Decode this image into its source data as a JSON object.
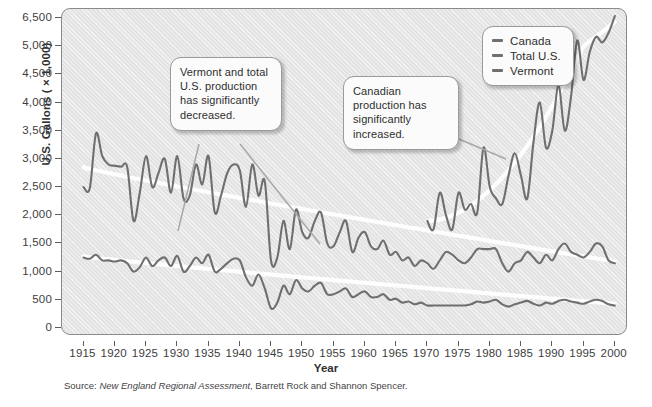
{
  "axis": {
    "ylabel": "U.S. Gallons ( × 1,000)",
    "xlabel": "Year",
    "yticks": [
      "6,500",
      "5,000",
      "4,500",
      "4,000",
      "3,500",
      "3,000",
      "2,500",
      "2,000",
      "1,500",
      "1,000",
      "500",
      "0"
    ],
    "xticks": [
      "1915",
      "1920",
      "1925",
      "1930",
      "1935",
      "1940",
      "1945",
      "1950",
      "1955",
      "1960",
      "1965",
      "1970",
      "1975",
      "1980",
      "1985",
      "1990",
      "1995",
      "2000"
    ]
  },
  "legend": {
    "items": [
      {
        "label": "Canada",
        "color": "#6f6f6f"
      },
      {
        "label": "Total U.S.",
        "color": "#6f6f6f"
      },
      {
        "label": "Vermont",
        "color": "#6f6f6f"
      }
    ]
  },
  "callouts": [
    {
      "id": "decrease",
      "text": "Vermont and total U.S. production has significantly decreased."
    },
    {
      "id": "increase",
      "text": "Canadian production has significantly increased."
    }
  ],
  "source": {
    "prefix": "Source: ",
    "title": "New England Regional Assessment",
    "suffix": ", Barrett Rock and Shannon Spencer."
  },
  "chart_data": {
    "type": "line",
    "title": "",
    "xlabel": "Year",
    "ylabel": "U.S. Gallons ( × 1,000)",
    "xlim": [
      1913,
      2001
    ],
    "ylim": [
      0,
      6500
    ],
    "ytick_values": [
      6500,
      5000,
      4500,
      4000,
      3500,
      3000,
      2500,
      2000,
      1500,
      1000,
      500,
      0
    ],
    "ytick_spacing_uniform": true,
    "xtick_values": [
      1915,
      1920,
      1925,
      1930,
      1935,
      1940,
      1945,
      1950,
      1955,
      1960,
      1965,
      1970,
      1975,
      1980,
      1985,
      1990,
      1995,
      2000
    ],
    "grid": false,
    "legend_position": "top-right",
    "annotations": [
      {
        "text": "Vermont and total U.S. production has significantly decreased.",
        "points_to": [
          "Vermont",
          "Total U.S."
        ]
      },
      {
        "text": "Canadian production has significantly increased.",
        "points_to": [
          "Canada"
        ]
      }
    ],
    "trend_lines": [
      {
        "series": "Total U.S.",
        "style": "white smoothed trend",
        "from": [
          1915,
          2850
        ],
        "to": [
          2000,
          1180
        ]
      },
      {
        "series": "Vermont",
        "style": "white smoothed trend",
        "from": [
          1915,
          1270
        ],
        "to": [
          2000,
          430
        ]
      },
      {
        "series": "Canada",
        "style": "white smoothed trend",
        "from": [
          1970,
          1900
        ],
        "to": [
          2000,
          6300
        ]
      }
    ],
    "series": [
      {
        "name": "Total U.S.",
        "color": "#6f6f6f",
        "x": [
          1915,
          1916,
          1917,
          1918,
          1919,
          1920,
          1921,
          1922,
          1923,
          1924,
          1925,
          1926,
          1927,
          1928,
          1929,
          1930,
          1931,
          1932,
          1933,
          1934,
          1935,
          1936,
          1937,
          1938,
          1939,
          1940,
          1941,
          1942,
          1943,
          1944,
          1945,
          1946,
          1947,
          1948,
          1949,
          1950,
          1951,
          1952,
          1953,
          1954,
          1955,
          1956,
          1957,
          1958,
          1959,
          1960,
          1961,
          1962,
          1963,
          1964,
          1965,
          1966,
          1967,
          1968,
          1969,
          1970,
          1971,
          1972,
          1973,
          1974,
          1975,
          1976,
          1977,
          1978,
          1979,
          1980,
          1981,
          1982,
          1983,
          1984,
          1985,
          1986,
          1987,
          1988,
          1989,
          1990,
          1991,
          1992,
          1993,
          1994,
          1995,
          1996,
          1997,
          1998,
          1999,
          2000
        ],
        "y": [
          2500,
          2480,
          3450,
          3050,
          2900,
          2880,
          2860,
          2850,
          1900,
          2400,
          3050,
          2500,
          2750,
          3000,
          2400,
          3050,
          2300,
          2350,
          2900,
          2550,
          3050,
          2050,
          2350,
          2750,
          2900,
          2800,
          2150,
          2900,
          2350,
          2600,
          1200,
          1250,
          1900,
          1400,
          2100,
          1700,
          1600,
          1900,
          2050,
          1500,
          1450,
          1700,
          1900,
          1350,
          1600,
          1700,
          1450,
          1400,
          1550,
          1300,
          1350,
          1200,
          1250,
          1100,
          1200,
          1150,
          1050,
          1200,
          1350,
          1300,
          1200,
          1150,
          1250,
          1400,
          1400,
          1400,
          1400,
          1150,
          1000,
          1150,
          1200,
          1350,
          1250,
          1150,
          1300,
          1200,
          1400,
          1500,
          1350,
          1300,
          1250,
          1350,
          1500,
          1450,
          1200,
          1150
        ]
      },
      {
        "name": "Vermont",
        "color": "#6f6f6f",
        "x": [
          1915,
          1916,
          1917,
          1918,
          1919,
          1920,
          1921,
          1922,
          1923,
          1924,
          1925,
          1926,
          1927,
          1928,
          1929,
          1930,
          1931,
          1932,
          1933,
          1934,
          1935,
          1936,
          1937,
          1938,
          1939,
          1940,
          1941,
          1942,
          1943,
          1944,
          1945,
          1946,
          1947,
          1948,
          1949,
          1950,
          1951,
          1952,
          1953,
          1954,
          1955,
          1956,
          1957,
          1958,
          1959,
          1960,
          1961,
          1962,
          1963,
          1964,
          1965,
          1966,
          1967,
          1968,
          1969,
          1970,
          1971,
          1972,
          1973,
          1974,
          1975,
          1976,
          1977,
          1978,
          1979,
          1980,
          1981,
          1982,
          1983,
          1984,
          1985,
          1986,
          1987,
          1988,
          1989,
          1990,
          1991,
          1992,
          1993,
          1994,
          1995,
          1996,
          1997,
          1998,
          1999,
          2000
        ],
        "y": [
          1250,
          1230,
          1300,
          1200,
          1200,
          1180,
          1200,
          1150,
          1000,
          1080,
          1250,
          1100,
          1200,
          1250,
          1100,
          1280,
          1000,
          1100,
          1250,
          1150,
          1300,
          1000,
          1050,
          1150,
          1230,
          1200,
          900,
          750,
          950,
          700,
          350,
          450,
          750,
          600,
          850,
          700,
          650,
          750,
          800,
          600,
          600,
          650,
          700,
          550,
          600,
          650,
          550,
          550,
          600,
          500,
          520,
          450,
          470,
          420,
          450,
          400,
          400,
          400,
          400,
          400,
          400,
          400,
          420,
          470,
          450,
          470,
          500,
          420,
          380,
          420,
          450,
          480,
          430,
          400,
          450,
          430,
          480,
          500,
          470,
          450,
          430,
          470,
          500,
          480,
          420,
          400
        ]
      },
      {
        "name": "Canada",
        "color": "#6f6f6f",
        "x": [
          1970,
          1971,
          1972,
          1973,
          1974,
          1975,
          1976,
          1977,
          1978,
          1979,
          1980,
          1981,
          1982,
          1983,
          1984,
          1985,
          1986,
          1987,
          1988,
          1989,
          1990,
          1991,
          1992,
          1993,
          1994,
          1995,
          1996,
          1997,
          1998,
          1999,
          2000
        ],
        "y": [
          1900,
          1750,
          2400,
          2000,
          1750,
          2400,
          2100,
          2200,
          2050,
          3200,
          2500,
          2300,
          2200,
          2700,
          3100,
          2700,
          2300,
          3300,
          4000,
          3200,
          3500,
          4300,
          3500,
          4100,
          5300,
          4400,
          4900,
          5500,
          5200,
          5700,
          6600
        ]
      }
    ]
  }
}
